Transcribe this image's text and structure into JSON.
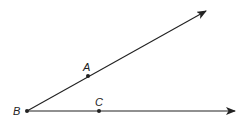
{
  "diagram": {
    "type": "angle",
    "vertex": {
      "label": "B",
      "x": 27,
      "y": 111
    },
    "rays": [
      {
        "name": "ray-BA",
        "through": {
          "label": "A",
          "x": 88,
          "y": 76
        },
        "end": {
          "x": 206,
          "y": 11
        }
      },
      {
        "name": "ray-BC",
        "through": {
          "label": "C",
          "x": 99,
          "y": 111
        },
        "end": {
          "x": 235,
          "y": 111
        }
      }
    ],
    "labels": {
      "B": "B",
      "A": "A",
      "C": "C"
    },
    "stroke_color": "#222222"
  }
}
